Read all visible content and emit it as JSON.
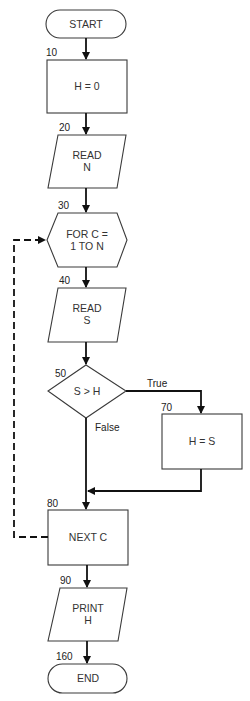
{
  "diagram": {
    "type": "flowchart",
    "title": "",
    "nodes": [
      {
        "id": "start",
        "shape": "terminal",
        "line_number": "",
        "lines": [
          "START"
        ]
      },
      {
        "id": "n10",
        "shape": "process",
        "line_number": "10",
        "lines": [
          "H = 0"
        ]
      },
      {
        "id": "n20",
        "shape": "input-output",
        "line_number": "20",
        "lines": [
          "READ",
          "N"
        ]
      },
      {
        "id": "n30",
        "shape": "loop-hexagon",
        "line_number": "30",
        "lines": [
          "FOR C =",
          "1 TO N"
        ]
      },
      {
        "id": "n40",
        "shape": "input-output",
        "line_number": "40",
        "lines": [
          "READ",
          "S"
        ]
      },
      {
        "id": "n50",
        "shape": "decision",
        "line_number": "50",
        "lines": [
          "S > H"
        ]
      },
      {
        "id": "n70",
        "shape": "process",
        "line_number": "70",
        "lines": [
          "H = S"
        ]
      },
      {
        "id": "n80",
        "shape": "process",
        "line_number": "80",
        "lines": [
          "NEXT C"
        ]
      },
      {
        "id": "n90",
        "shape": "input-output",
        "line_number": "90",
        "lines": [
          "PRINT",
          "H"
        ]
      },
      {
        "id": "end",
        "shape": "terminal",
        "line_number": "160",
        "lines": [
          "END"
        ]
      }
    ],
    "edges": [
      {
        "from": "start",
        "to": "n10",
        "label": "",
        "style": "solid"
      },
      {
        "from": "n10",
        "to": "n20",
        "label": "",
        "style": "solid"
      },
      {
        "from": "n20",
        "to": "n30",
        "label": "",
        "style": "solid"
      },
      {
        "from": "n30",
        "to": "n40",
        "label": "",
        "style": "solid"
      },
      {
        "from": "n40",
        "to": "n50",
        "label": "",
        "style": "solid"
      },
      {
        "from": "n50",
        "to": "n70",
        "label": "True",
        "style": "solid"
      },
      {
        "from": "n50",
        "to": "n80",
        "label": "False",
        "style": "solid"
      },
      {
        "from": "n70",
        "to": "n80",
        "label": "",
        "style": "solid"
      },
      {
        "from": "n80",
        "to": "n30",
        "label": "",
        "style": "dashed"
      },
      {
        "from": "n80",
        "to": "n90",
        "label": "",
        "style": "solid"
      },
      {
        "from": "n90",
        "to": "end",
        "label": "",
        "style": "solid"
      }
    ],
    "branch_labels": {
      "true": "True",
      "false": "False"
    },
    "colors": {
      "stroke": "#3a3a3a",
      "line": "#111111",
      "text": "#333333",
      "background": "#ffffff"
    }
  }
}
